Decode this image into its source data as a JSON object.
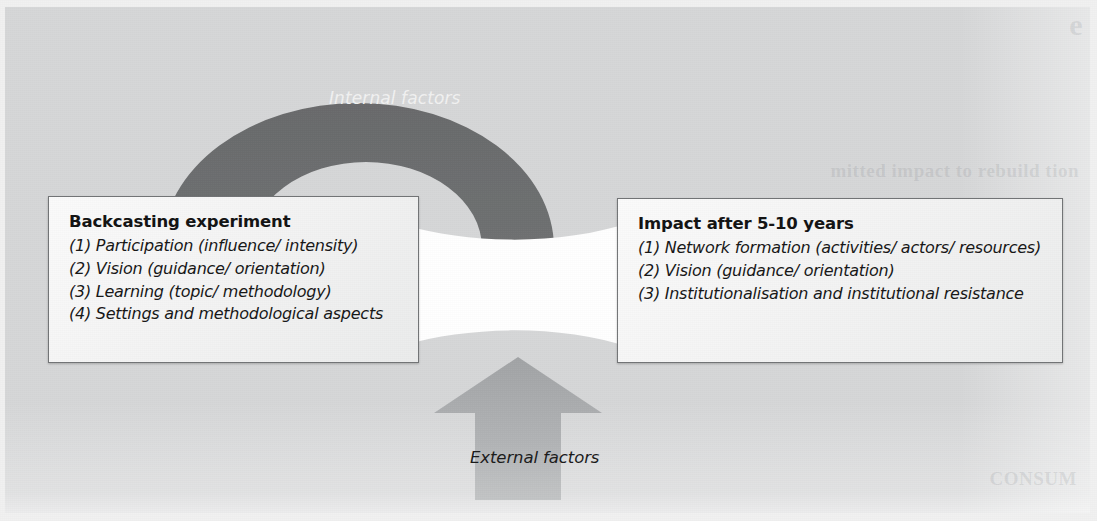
{
  "diagram": {
    "colors": {
      "background": "#d6d7d8",
      "internal_arrow": "#6d6e6f",
      "external_arrow": "#a9abac",
      "connector": "#ffffff",
      "box_border": "#737577",
      "box_fill": "#f4f4f4"
    },
    "left_box": {
      "title": "Backcasting experiment",
      "items": [
        "(1) Participation (influence/ intensity)",
        "(2) Vision (guidance/ orientation)",
        "(3) Learning (topic/ methodology)",
        "(4) Settings and methodological aspects"
      ]
    },
    "right_box": {
      "title": "Impact after 5-10 years",
      "items": [
        "(1) Network formation (activities/ actors/ resources)",
        "(2) Vision (guidance/ orientation)",
        "(3) Institutionalisation and institutional resistance"
      ]
    },
    "internal_arrow": {
      "label": "Internal factors",
      "shape": "curved-down-arrow",
      "direction": "down"
    },
    "external_arrow": {
      "label": "External factors",
      "shape": "straight-up-arrow",
      "direction": "up"
    },
    "connector": {
      "label": "",
      "shape": "bowtie-band"
    },
    "ghost_text": {
      "line1": "e",
      "line2": "mitted impact to rebuild tion",
      "line3": "CONSUM"
    }
  }
}
